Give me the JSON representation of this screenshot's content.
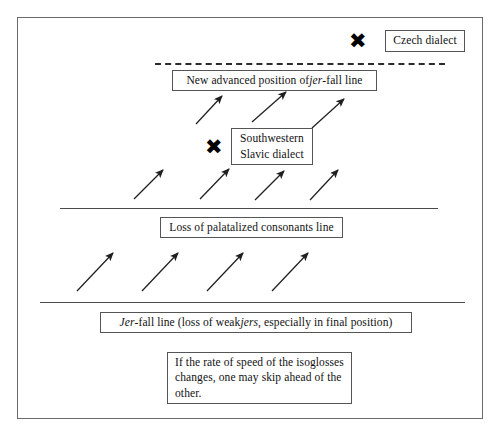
{
  "figure": {
    "type": "linguistic-isogloss-diagram",
    "border_color": "#6b6b6b",
    "background": "#ffffff"
  },
  "markers": [
    {
      "id": "czech",
      "glyph": "✖",
      "label": "Czech dialect",
      "x": 358,
      "y": 42
    },
    {
      "id": "southwestern-slavic",
      "glyph": "✖",
      "label": "Southwestern\nSlavic dialect",
      "x": 214,
      "y": 148
    }
  ],
  "boxes": {
    "czech_dialect": {
      "text": "Czech dialect",
      "x": 385,
      "y": 30,
      "w": 80,
      "h": 22
    },
    "new_advanced_position": {
      "text_before": "New advanced position of ",
      "text_italic": "jer",
      "text_after": "-fall line",
      "text": "New advanced position of jer-fall line",
      "x": 172,
      "y": 70,
      "w": 205,
      "h": 21
    },
    "southwestern_slavic": {
      "text": "Southwestern\nSlavic dialect",
      "x": 231,
      "y": 128,
      "w": 82,
      "h": 37
    },
    "loss_of_palatalized": {
      "text": "Loss of palatalized consonants line",
      "x": 160,
      "y": 217,
      "w": 183,
      "h": 21
    },
    "jer_fall_line": {
      "text_italic_1": "Jer",
      "text_mid": "-fall line (loss of weak ",
      "text_italic_2": "jers",
      "text_end": ", especially in final position)",
      "text": "Jer-fall line (loss of weak jers, especially in final position)",
      "x": 100,
      "y": 312,
      "w": 312,
      "h": 21
    },
    "note": {
      "text": "If the rate of speed of the isoglosses changes, one may skip ahead of the other.",
      "x": 167,
      "y": 352,
      "w": 185,
      "h": 52
    }
  },
  "lines": [
    {
      "id": "new-advanced-jer-fall-line",
      "style": "dashed",
      "x1": 155,
      "y1": 63,
      "x2": 445,
      "y2": 63
    },
    {
      "id": "loss-of-palatalized-consonants-line",
      "style": "solid",
      "x1": 60,
      "y1": 208,
      "x2": 438,
      "y2": 208
    },
    {
      "id": "jer-fall-line",
      "style": "solid",
      "x1": 40,
      "y1": 302,
      "x2": 465,
      "y2": 302
    }
  ],
  "arrows": {
    "description": "Diagonal arrows pointing up and to the right, indicating isogloss spread",
    "groups": [
      {
        "id": "arrow-row-top",
        "count": 3,
        "items": [
          {
            "x1": 196,
            "y1": 124,
            "x2": 222,
            "y2": 96
          },
          {
            "x1": 252,
            "y1": 122,
            "x2": 286,
            "y2": 92
          },
          {
            "x1": 312,
            "y1": 128,
            "x2": 344,
            "y2": 99
          }
        ]
      },
      {
        "id": "arrow-row-middle",
        "count": 4,
        "items": [
          {
            "x1": 134,
            "y1": 199,
            "x2": 163,
            "y2": 170
          },
          {
            "x1": 200,
            "y1": 199,
            "x2": 229,
            "y2": 169
          },
          {
            "x1": 255,
            "y1": 200,
            "x2": 284,
            "y2": 171
          },
          {
            "x1": 310,
            "y1": 200,
            "x2": 338,
            "y2": 170
          }
        ]
      },
      {
        "id": "arrow-row-bottom",
        "count": 4,
        "items": [
          {
            "x1": 77,
            "y1": 291,
            "x2": 113,
            "y2": 253
          },
          {
            "x1": 142,
            "y1": 291,
            "x2": 178,
            "y2": 253
          },
          {
            "x1": 207,
            "y1": 291,
            "x2": 243,
            "y2": 253
          },
          {
            "x1": 272,
            "y1": 291,
            "x2": 308,
            "y2": 253
          }
        ]
      }
    ]
  }
}
